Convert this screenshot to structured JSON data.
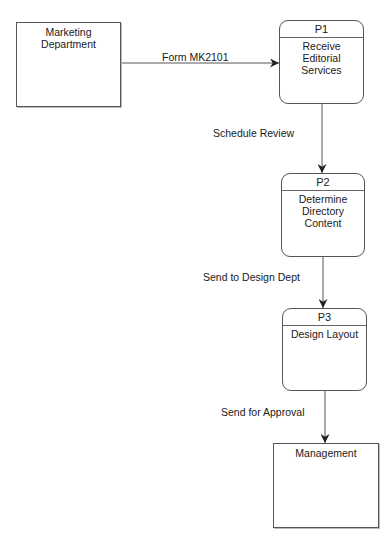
{
  "diagram": {
    "type": "data-flow-diagram",
    "external_entities": [
      {
        "id": "marketing",
        "label": "Marketing Department"
      },
      {
        "id": "management",
        "label": "Management"
      }
    ],
    "processes": [
      {
        "id": "P1",
        "label": "Receive Editorial Services"
      },
      {
        "id": "P2",
        "label": "Determine Directory Content"
      },
      {
        "id": "P3",
        "label": "Design Layout"
      }
    ],
    "flows": [
      {
        "from": "marketing",
        "to": "P1",
        "label": "Form MK2101"
      },
      {
        "from": "P1",
        "to": "P2",
        "label": "Schedule Review"
      },
      {
        "from": "P2",
        "to": "P3",
        "label": "Send to Design Dept"
      },
      {
        "from": "P3",
        "to": "management",
        "label": "Send for Approval"
      }
    ]
  },
  "entities": {
    "marketing": {
      "line1": "Marketing",
      "line2": "Department"
    },
    "management": {
      "line1": "Management"
    }
  },
  "processes": {
    "p1": {
      "id": "P1",
      "line1": "Receive",
      "line2": "Editorial",
      "line3": "Services"
    },
    "p2": {
      "id": "P2",
      "line1": "Determine",
      "line2": "Directory",
      "line3": "Content"
    },
    "p3": {
      "id": "P3",
      "line1": "Design Layout"
    }
  },
  "flows": {
    "f1": "Form MK2101",
    "f2": "Schedule Review",
    "f3": "Send to Design Dept",
    "f4": "Send for Approval"
  },
  "colors": {
    "line": "#555555",
    "text": "#1a1a1a",
    "background": "#ffffff"
  }
}
